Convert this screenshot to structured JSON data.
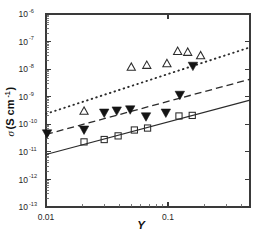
{
  "chart_data": {
    "type": "scatter",
    "title": "",
    "xlabel": "Y",
    "ylabel": "σ (S cm⁻¹)",
    "xscale": "log",
    "yscale": "log",
    "xlim": [
      0.01,
      0.47
    ],
    "ylim": [
      1e-13,
      1e-06
    ],
    "grid": false,
    "legend": "none",
    "x_tick_labels": [
      "0.01",
      "0.1"
    ],
    "x_tick_values": [
      0.01,
      0.1
    ],
    "y_tick_labels": [
      "10-6",
      "10-7",
      "10-8",
      "10-9",
      "10-10",
      "10-11",
      "10-12",
      "10-13"
    ],
    "y_tick_mantissa": "10",
    "y_tick_exponents": [
      "-6",
      "-7",
      "-8",
      "-9",
      "-10",
      "-11",
      "-12",
      "-13"
    ],
    "y_tick_values": [
      1e-06,
      1e-07,
      1e-08,
      1e-09,
      1e-10,
      1e-11,
      1e-12,
      1e-13
    ],
    "series": [
      {
        "name": "open-triangle-series",
        "marker": "open-triangle-up",
        "points": [
          {
            "x": 0.0205,
            "y": 2.9e-10
          },
          {
            "x": 0.05,
            "y": 1.15e-08
          },
          {
            "x": 0.067,
            "y": 1.35e-08
          },
          {
            "x": 0.098,
            "y": 1.55e-08
          },
          {
            "x": 0.12,
            "y": 4.3e-08
          },
          {
            "x": 0.145,
            "y": 4e-08
          },
          {
            "x": 0.185,
            "y": 3e-08
          }
        ]
      },
      {
        "name": "filled-down-triangle-series",
        "marker": "filled-triangle-down",
        "points": [
          {
            "x": 0.0102,
            "y": 4.6e-11
          },
          {
            "x": 0.0205,
            "y": 6.3e-11
          },
          {
            "x": 0.03,
            "y": 2.6e-10
          },
          {
            "x": 0.038,
            "y": 3.1e-10
          },
          {
            "x": 0.049,
            "y": 3.4e-10
          },
          {
            "x": 0.066,
            "y": 1.9e-10
          },
          {
            "x": 0.096,
            "y": 2.6e-10
          },
          {
            "x": 0.125,
            "y": 1.15e-09
          },
          {
            "x": 0.16,
            "y": 1.3e-08
          }
        ]
      },
      {
        "name": "open-square-series",
        "marker": "open-square",
        "points": [
          {
            "x": 0.0205,
            "y": 2.3e-11
          },
          {
            "x": 0.03,
            "y": 2.8e-11
          },
          {
            "x": 0.039,
            "y": 3.8e-11
          },
          {
            "x": 0.053,
            "y": 6.2e-11
          },
          {
            "x": 0.068,
            "y": 7.3e-11
          },
          {
            "x": 0.123,
            "y": 2e-10
          },
          {
            "x": 0.158,
            "y": 2.1e-10
          }
        ]
      }
    ],
    "fit_lines": [
      {
        "name": "solid-fit-line",
        "style": "solid",
        "x1": 0.01,
        "y1": 8e-12,
        "x2": 0.47,
        "y2": 7.5e-10
      },
      {
        "name": "dashed-fit-line",
        "style": "dashed",
        "x1": 0.01,
        "y1": 4.3e-11,
        "x2": 0.47,
        "y2": 4.3e-09
      },
      {
        "name": "dotted-fit-line",
        "style": "dotted",
        "x1": 0.01,
        "y1": 2.4e-10,
        "x2": 0.47,
        "y2": 6.2e-08
      }
    ]
  }
}
